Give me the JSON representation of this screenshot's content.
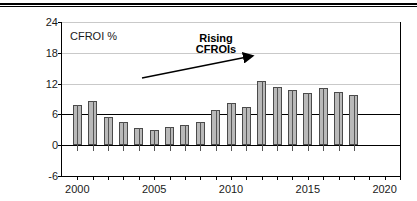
{
  "chart_data": {
    "type": "bar",
    "title": "",
    "xlabel": "",
    "ylabel": "CFROI %",
    "ylim": [
      -6,
      24
    ],
    "xlim": [
      1999,
      2021
    ],
    "ytick_labels": [
      "24",
      "18",
      "12",
      "6",
      "0",
      "-6"
    ],
    "ytick_values": [
      24,
      18,
      12,
      6,
      0,
      -6
    ],
    "xtick_labels": [
      "2000",
      "2005",
      "2010",
      "2015",
      "2020"
    ],
    "xtick_values": [
      2000,
      2005,
      2010,
      2015,
      2020
    ],
    "grid": "horizontal",
    "legend": "none",
    "emphasis_line": 6,
    "categories": [
      2000,
      2001,
      2002,
      2003,
      2004,
      2005,
      2006,
      2007,
      2008,
      2009,
      2010,
      2011,
      2012,
      2013,
      2014,
      2015,
      2016,
      2017,
      2018
    ],
    "values": [
      7.9,
      8.6,
      5.5,
      4.5,
      3.3,
      3.0,
      3.6,
      4.0,
      4.5,
      6.9,
      8.2,
      7.5,
      12.6,
      11.3,
      10.8,
      10.2,
      11.2,
      10.4,
      9.7
    ],
    "annotations": [
      {
        "text_line1": "Rising",
        "text_line2": "CFROIs",
        "type": "arrow-label"
      }
    ]
  },
  "axis": {
    "y_label_inline": "CFROI %"
  },
  "annotation": {
    "line1": "Rising",
    "line2": "CFROIs"
  },
  "colors": {
    "bar_fill": "#b9b9b9",
    "bar_edge": "#4a4a4a",
    "grid": "#c9c9c9",
    "axis": "#000000"
  }
}
